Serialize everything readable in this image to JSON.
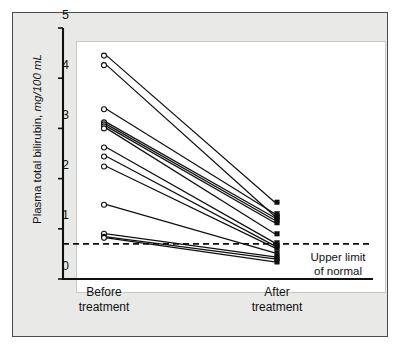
{
  "figure": {
    "panel_background": "#e9e9e7",
    "plot_background": "#ffffff",
    "line_color": "#101010",
    "marker_open_fill": "#ffffff",
    "marker_closed_fill": "#101010"
  },
  "chart_data": {
    "type": "line",
    "title": "",
    "subtitle": "",
    "xlabel": "",
    "ylabel": "Plasma total bilirubin, mg/100 mL",
    "ylabel_plain": "Plasma total bilirubin,",
    "ylabel_units": "mg/100 mL",
    "x": [
      "Before treatment",
      "After treatment"
    ],
    "x_tick_labels": [
      {
        "line1": "Before",
        "line2": "treatment"
      },
      {
        "line1": "After",
        "line2": "treatment"
      }
    ],
    "y_ticks": [
      0,
      1,
      2,
      3,
      4,
      5
    ],
    "y_tick_labels": [
      "0",
      "1",
      "2",
      "3",
      "4",
      "5"
    ],
    "ylim": [
      0,
      5
    ],
    "grid": false,
    "legend": "none",
    "marker_before": "open-circle",
    "marker_after": "filled-square",
    "annotations": [
      {
        "name": "upper-limit-of-normal",
        "line1": "Upper limit",
        "line2": "of normal",
        "value": 0.7,
        "style": "dashed-horizontal-line"
      }
    ],
    "series": [
      {
        "name": "subject-1",
        "values": [
          4.45,
          1.53
        ]
      },
      {
        "name": "subject-2",
        "values": [
          4.26,
          1.25
        ]
      },
      {
        "name": "subject-3",
        "values": [
          3.38,
          1.3
        ]
      },
      {
        "name": "subject-4",
        "values": [
          3.12,
          1.22
        ]
      },
      {
        "name": "subject-5",
        "values": [
          3.08,
          1.17
        ]
      },
      {
        "name": "subject-6",
        "values": [
          3.04,
          1.12
        ]
      },
      {
        "name": "subject-7",
        "values": [
          3.0,
          0.9
        ]
      },
      {
        "name": "subject-8",
        "values": [
          2.62,
          0.72
        ]
      },
      {
        "name": "subject-9",
        "values": [
          2.44,
          0.66
        ]
      },
      {
        "name": "subject-10",
        "values": [
          2.24,
          0.62
        ]
      },
      {
        "name": "subject-11",
        "values": [
          1.48,
          0.52
        ]
      },
      {
        "name": "subject-12",
        "values": [
          0.9,
          0.44
        ]
      },
      {
        "name": "subject-13",
        "values": [
          0.84,
          0.4
        ]
      },
      {
        "name": "subject-14",
        "values": [
          0.82,
          0.34
        ]
      }
    ]
  }
}
